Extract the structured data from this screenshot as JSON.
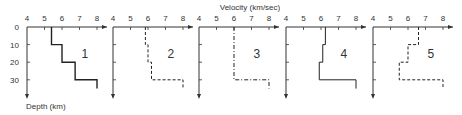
{
  "figure": {
    "x_title": "Velocity (km/sec)",
    "y_title": "Depth (km)"
  },
  "chart_data": {
    "type": "line",
    "title": "",
    "xlabel": "Velocity (km/sec)",
    "ylabel": "Depth (km)",
    "xlim": [
      4,
      8
    ],
    "ylim": [
      0,
      35
    ],
    "x_ticks": [
      "4",
      "5",
      "6",
      "7",
      "8"
    ],
    "y_ticks": [
      "0",
      "10",
      "20",
      "30"
    ],
    "grid": false,
    "legend": "none",
    "panels": [
      {
        "label": "1",
        "line_style": "solid-thick",
        "layers": [
          {
            "depth_top": 0,
            "depth_bottom": 10,
            "velocity": 5.4
          },
          {
            "depth_top": 10,
            "depth_bottom": 20,
            "velocity": 6.0
          },
          {
            "depth_top": 20,
            "depth_bottom": 30,
            "velocity": 6.75
          },
          {
            "depth_top": 30,
            "depth_bottom": 35,
            "velocity": 8.0
          }
        ]
      },
      {
        "label": "2",
        "line_style": "dashed",
        "layers": [
          {
            "depth_top": 0,
            "depth_bottom": 10,
            "velocity": 5.85
          },
          {
            "depth_top": 10,
            "depth_bottom": 20,
            "velocity": 6.0
          },
          {
            "depth_top": 20,
            "depth_bottom": 30,
            "velocity": 6.2
          },
          {
            "depth_top": 30,
            "depth_bottom": 35,
            "velocity": 8.0
          }
        ]
      },
      {
        "label": "3",
        "line_style": "dash-dot",
        "layers": [
          {
            "depth_top": 0,
            "depth_bottom": 30,
            "velocity": 6.0
          },
          {
            "depth_top": 30,
            "depth_bottom": 35,
            "velocity": 8.0
          }
        ]
      },
      {
        "label": "4",
        "line_style": "solid-thin",
        "layers": [
          {
            "depth_top": 0,
            "depth_bottom": 10,
            "velocity": 6.25
          },
          {
            "depth_top": 10,
            "depth_bottom": 20,
            "velocity": 6.1
          },
          {
            "depth_top": 20,
            "depth_bottom": 30,
            "velocity": 5.9
          },
          {
            "depth_top": 30,
            "depth_bottom": 35,
            "velocity": 8.0
          }
        ]
      },
      {
        "label": "5",
        "line_style": "dashed",
        "layers": [
          {
            "depth_top": 0,
            "depth_bottom": 10,
            "velocity": 6.6
          },
          {
            "depth_top": 10,
            "depth_bottom": 20,
            "velocity": 6.0
          },
          {
            "depth_top": 20,
            "depth_bottom": 30,
            "velocity": 5.5
          },
          {
            "depth_top": 30,
            "depth_bottom": 35,
            "velocity": 8.0
          }
        ]
      }
    ]
  }
}
